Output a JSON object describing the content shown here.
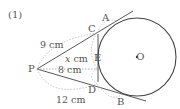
{
  "problem_label": "(1)",
  "points": {
    "P": "P",
    "A": "A",
    "B": "B",
    "C": "C",
    "D": "D",
    "E": "E",
    "O": "O"
  },
  "measurements": {
    "PC": "9 cm",
    "PE_var": "x",
    "PE_unit": "cm",
    "PE_dotted": "8 cm",
    "PD": "12 cm"
  },
  "colors": {
    "line": "#444444",
    "dotted": "#999999",
    "text": "#555555"
  }
}
